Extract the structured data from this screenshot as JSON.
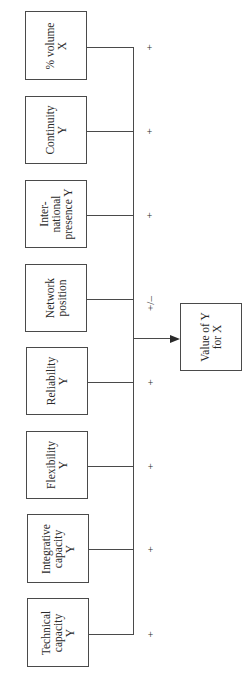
{
  "diagram": {
    "type": "flow / factor diagram (rotated 90°)",
    "inputs": [
      {
        "label": "% volume\nX",
        "sign": "+"
      },
      {
        "label": "Continuity\nY",
        "sign": "+"
      },
      {
        "label": "Inter-\nnational\npresence Y",
        "sign": "+"
      },
      {
        "label": "Network\nposition",
        "sign": "+/–"
      },
      {
        "label": "Reliability\nY",
        "sign": "+"
      },
      {
        "label": "Flexibility\nY",
        "sign": "+"
      },
      {
        "label": "Integrative\ncapacity\nY",
        "sign": "+"
      },
      {
        "label": "Technical\ncapacity\nY",
        "sign": "+"
      }
    ],
    "output": {
      "label": "Value of Y\nfor X"
    },
    "colors": {
      "line": "#4a4a4a",
      "text": "#2a2a2a",
      "background": "#ffffff"
    }
  }
}
